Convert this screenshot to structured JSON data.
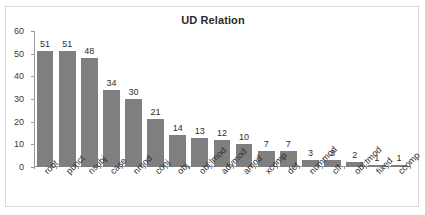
{
  "top_caption": "",
  "chart_frame": {
    "border_color": "#d9d9d9",
    "background": "#ffffff"
  },
  "chart_data": {
    "type": "bar",
    "title": "UD Relation",
    "xlabel": "",
    "ylabel": "",
    "ylim": [
      0,
      60
    ],
    "yticks": [
      0,
      10,
      20,
      30,
      40,
      50,
      60
    ],
    "grid": false,
    "legend": false,
    "bar_color": "#7f7f7f",
    "data_labels": true,
    "categories": [
      "root",
      "punct",
      "nsubj",
      "case",
      "nmod",
      "conj",
      "obj",
      "obl:lmod",
      "advmod",
      "amod",
      "xcomp",
      "det",
      "nummod",
      "clf",
      "obl:tmod",
      "fixed",
      "ccomp"
    ],
    "values": [
      51,
      51,
      48,
      34,
      30,
      21,
      14,
      13,
      12,
      10,
      7,
      7,
      3,
      3,
      2,
      1,
      1
    ]
  }
}
